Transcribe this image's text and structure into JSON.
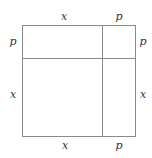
{
  "diagram": {
    "type": "area-model-square",
    "line_color": "#8a8a8a",
    "label_color": "#333333",
    "labels": {
      "top_left": "x",
      "top_right": "p",
      "left_top": "p",
      "left_bottom": "x",
      "right_top": "p",
      "right_bottom": "x",
      "bottom_left": "x",
      "bottom_right": "p"
    }
  }
}
